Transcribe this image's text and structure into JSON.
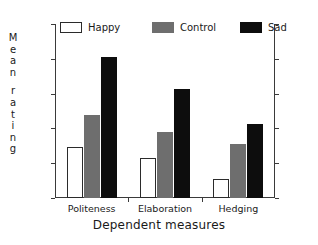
{
  "chart_data": {
    "type": "bar",
    "title": "",
    "xlabel": "Dependent measures",
    "ylabel": "Mean rating",
    "categories": [
      "Politeness",
      "Elaboration",
      "Hedging"
    ],
    "series": [
      {
        "name": "Happy",
        "values": [
          2.73,
          2.57,
          2.27
        ],
        "color": "#ffffff"
      },
      {
        "name": "Control",
        "values": [
          3.19,
          2.95,
          2.78
        ],
        "color": "#6e6e6e"
      },
      {
        "name": "Sad",
        "values": [
          4.02,
          3.57,
          3.06
        ],
        "color": "#0d0d0d"
      }
    ],
    "ylim": [
      2,
      4.5
    ],
    "ytick_values": [
      4.5,
      4,
      3.5,
      3,
      2.5,
      2
    ],
    "ytick_labels": [
      "4.5",
      "4",
      "3.5",
      "3",
      "2.5",
      "2"
    ],
    "ytick_labels_right": [
      "4.5",
      "4",
      "3.5",
      "3",
      "2.5",
      "2"
    ],
    "grid": false,
    "legend_position": "top-inside",
    "dual_y_axis": true
  },
  "ylabel_letters": [
    "M",
    "e",
    "a",
    "n",
    "",
    "r",
    "a",
    "t",
    "i",
    "n",
    "g"
  ],
  "legend": {
    "items": [
      {
        "label": "Happy",
        "swatch": "white-rect-outlined"
      },
      {
        "label": "Control",
        "swatch": "gray-rect-filled"
      },
      {
        "label": "Sad",
        "swatch": "black-rect-filled"
      }
    ]
  },
  "axis_titles": {
    "x": "Dependent measures",
    "y": "Mean rating"
  }
}
